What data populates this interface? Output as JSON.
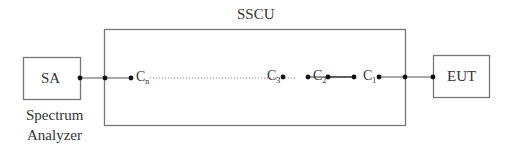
{
  "diagram": {
    "sscu_label": "SSCU",
    "sa": {
      "label": "SA",
      "caption_line1": "Spectrum",
      "caption_line2": "Analyzer"
    },
    "eut": {
      "label": "EUT"
    },
    "components": [
      {
        "base": "C",
        "sub": "n"
      },
      {
        "base": "C",
        "sub": "3"
      },
      {
        "base": "C",
        "sub": "2"
      },
      {
        "base": "C",
        "sub": "1"
      }
    ]
  }
}
